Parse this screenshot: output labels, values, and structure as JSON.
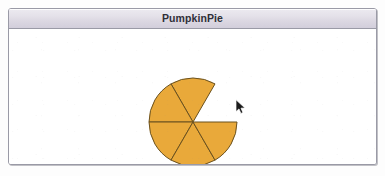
{
  "window": {
    "title": "PumpkinPie",
    "title_color": "#2f2f38",
    "border_color": "#9a9aa6",
    "titlebar_gradient_top": "#eceaf0",
    "titlebar_gradient_bottom": "#d2cedb",
    "content_background": "#ffffff"
  },
  "cursor": {
    "name": "arrow-pointer",
    "x": 229,
    "y": 79
  },
  "chart_data": {
    "type": "pie",
    "title": "PumpkinPie",
    "center_x": 184,
    "center_y": 93,
    "radius": 44,
    "slice_count": 6,
    "slices_drawn": 5,
    "slice_angle_degrees": 60,
    "missing_slice_start_deg": 0,
    "missing_slice_end_deg": 60,
    "fill_color": "#e9a93a",
    "stroke_color": "#6b5220",
    "stroke_width": 1,
    "categories": [
      "Slice 1",
      "Slice 2",
      "Slice 3",
      "Slice 4",
      "Slice 5",
      "Slice 6"
    ],
    "values": [
      60,
      60,
      60,
      60,
      60,
      60
    ],
    "drawn": [
      false,
      true,
      true,
      true,
      true,
      true
    ],
    "legend": "none",
    "grid": false,
    "labels_shown": false
  }
}
